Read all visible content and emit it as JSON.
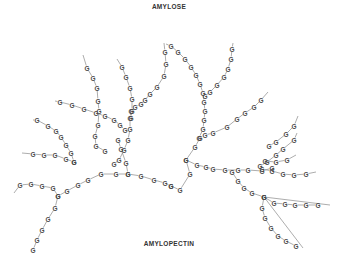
{
  "labels": {
    "top": "AMYLOSE",
    "bottom": "AMYLOPECTIN",
    "unit": "G"
  },
  "colors": {
    "text": "#333333",
    "glyph": "#4a4a4a",
    "bond": "#8a8a8a",
    "background": "#ffffff"
  },
  "chains": [
    {
      "name": "trunk-right",
      "lead": [
        166,
        44
      ],
      "nodes": [
        [
          171,
          46
        ],
        [
          178,
          52
        ],
        [
          185,
          59
        ],
        [
          191,
          67
        ],
        [
          196,
          75
        ],
        [
          200,
          84
        ],
        [
          203,
          93
        ],
        [
          204,
          102
        ],
        [
          205,
          111
        ],
        [
          204,
          120
        ],
        [
          203,
          129
        ],
        [
          199,
          138
        ]
      ]
    },
    {
      "name": "top-right-branch",
      "lead": [
        233,
        43
      ],
      "nodes": [
        [
          232,
          49
        ],
        [
          231,
          59
        ],
        [
          228,
          69
        ],
        [
          224,
          77
        ],
        [
          217,
          85
        ],
        [
          210,
          92
        ],
        [
          205,
          96
        ]
      ]
    },
    {
      "name": "left-top-chain",
      "lead": [
        164,
        43
      ],
      "nodes": [
        [
          165,
          52
        ],
        [
          166,
          64
        ],
        [
          164,
          76
        ],
        [
          157,
          87
        ],
        [
          150,
          94
        ],
        [
          145,
          100
        ],
        [
          141,
          104
        ],
        [
          135,
          107
        ],
        [
          131,
          111
        ],
        [
          130,
          118
        ],
        [
          130,
          129
        ],
        [
          128,
          140
        ],
        [
          124,
          150
        ],
        [
          119,
          160
        ],
        [
          114,
          164
        ]
      ]
    },
    {
      "name": "left-upper-branch",
      "lead": [
        117,
        59
      ],
      "nodes": [
        [
          122,
          67
        ],
        [
          126,
          77
        ],
        [
          130,
          88
        ],
        [
          132,
          99
        ],
        [
          132,
          111
        ],
        [
          131,
          118
        ]
      ]
    },
    {
      "name": "mid-left-branch",
      "lead": [
        83,
        55
      ],
      "nodes": [
        [
          87,
          68
        ],
        [
          93,
          78
        ],
        [
          97,
          88
        ],
        [
          98,
          101
        ],
        [
          99,
          111
        ],
        [
          98,
          125
        ],
        [
          95,
          136
        ],
        [
          96,
          146
        ],
        [
          105,
          151
        ]
      ]
    },
    {
      "name": "left-mid-chain",
      "lead": [
        55,
        101
      ],
      "nodes": [
        [
          60,
          102
        ],
        [
          72,
          105
        ],
        [
          84,
          109
        ],
        [
          96,
          113
        ],
        [
          105,
          116
        ],
        [
          114,
          120
        ],
        [
          120,
          125
        ],
        [
          125,
          130
        ]
      ]
    },
    {
      "name": "left-lower-chain",
      "lead": [
        33,
        120
      ],
      "nodes": [
        [
          37,
          120
        ],
        [
          48,
          126
        ],
        [
          56,
          131
        ],
        [
          61,
          137
        ],
        [
          66,
          145
        ],
        [
          71,
          153
        ],
        [
          74,
          162
        ]
      ]
    },
    {
      "name": "left-mid-2",
      "lead": [
        22,
        153
      ],
      "nodes": [
        [
          33,
          154
        ],
        [
          44,
          155
        ],
        [
          55,
          155
        ],
        [
          66,
          159
        ],
        [
          74,
          162
        ]
      ]
    },
    {
      "name": "left-bottom-arc",
      "lead": [
        14,
        193
      ],
      "nodes": [
        [
          20,
          185
        ],
        [
          31,
          184
        ],
        [
          42,
          186
        ],
        [
          53,
          188
        ],
        [
          58,
          196
        ],
        [
          55,
          208
        ],
        [
          48,
          219
        ],
        [
          42,
          230
        ],
        [
          37,
          240
        ],
        [
          33,
          250
        ]
      ]
    },
    {
      "name": "bottom-arc-right",
      "lead": [
        -1,
        -1
      ],
      "nodes": [
        [
          58,
          196
        ],
        [
          67,
          191
        ],
        [
          78,
          185
        ],
        [
          88,
          180
        ],
        [
          101,
          174
        ],
        [
          116,
          174
        ],
        [
          128,
          174
        ],
        [
          141,
          176
        ],
        [
          154,
          180
        ],
        [
          165,
          183
        ],
        [
          171,
          186
        ]
      ]
    },
    {
      "name": "bottom-mid-branch",
      "lead": [
        -1,
        -1
      ],
      "nodes": [
        [
          128,
          174
        ],
        [
          126,
          163
        ],
        [
          121,
          149
        ],
        [
          118,
          140
        ]
      ]
    },
    {
      "name": "center-right-arc",
      "lead": [
        -1,
        -1
      ],
      "nodes": [
        [
          171,
          186
        ],
        [
          180,
          190
        ],
        [
          190,
          174
        ],
        [
          186,
          160
        ],
        [
          195,
          147
        ],
        [
          200,
          138
        ]
      ]
    },
    {
      "name": "center-side",
      "lead": [
        -1,
        -1
      ],
      "nodes": [
        [
          186,
          160
        ],
        [
          197,
          165
        ],
        [
          206,
          167
        ],
        [
          213,
          169
        ],
        [
          225,
          170
        ],
        [
          238,
          170
        ],
        [
          248,
          170
        ],
        [
          262,
          171
        ],
        [
          272,
          168
        ]
      ]
    },
    {
      "name": "right-up-branch",
      "lead": [
        297,
        133
      ],
      "nodes": [
        [
          294,
          140
        ],
        [
          283,
          149
        ],
        [
          276,
          155
        ],
        [
          267,
          162
        ],
        [
          260,
          166
        ]
      ]
    },
    {
      "name": "right-mid-chain",
      "lead": [
        316,
        172
      ],
      "nodes": [
        [
          306,
          174
        ],
        [
          294,
          175
        ],
        [
          283,
          174
        ],
        [
          272,
          171
        ],
        [
          262,
          169
        ]
      ]
    },
    {
      "name": "right-lower-chain",
      "lead": [
        -1,
        -1
      ],
      "nodes": [
        [
          232,
          172
        ],
        [
          238,
          181
        ],
        [
          244,
          188
        ],
        [
          252,
          193
        ],
        [
          264,
          197
        ]
      ]
    },
    {
      "name": "right-lower-side",
      "lead": [
        330,
        205
      ],
      "nodes": [
        [
          264,
          197
        ],
        [
          274,
          203
        ],
        [
          285,
          204
        ],
        [
          295,
          205
        ],
        [
          306,
          205
        ],
        [
          318,
          205
        ]
      ]
    },
    {
      "name": "right-bottom-tail",
      "lead": [
        303,
        248
      ],
      "nodes": [
        [
          264,
          197
        ],
        [
          262,
          208
        ],
        [
          265,
          218
        ],
        [
          271,
          228
        ],
        [
          278,
          236
        ],
        [
          286,
          241
        ],
        [
          296,
          246
        ]
      ]
    },
    {
      "name": "top-right-arm",
      "lead": [
        298,
        116
      ],
      "nodes": [
        [
          294,
          126
        ],
        [
          286,
          134
        ],
        [
          276,
          142
        ],
        [
          269,
          146
        ]
      ]
    },
    {
      "name": "right-arm",
      "lead": [
        296,
        155
      ],
      "nodes": [
        [
          287,
          160
        ],
        [
          276,
          162
        ],
        [
          265,
          161
        ]
      ]
    },
    {
      "name": "upper-right-mid",
      "lead": [
        268,
        92
      ],
      "nodes": [
        [
          261,
          100
        ],
        [
          254,
          107
        ],
        [
          245,
          113
        ],
        [
          237,
          119
        ],
        [
          227,
          127
        ],
        [
          213,
          133
        ],
        [
          205,
          135
        ]
      ]
    }
  ]
}
